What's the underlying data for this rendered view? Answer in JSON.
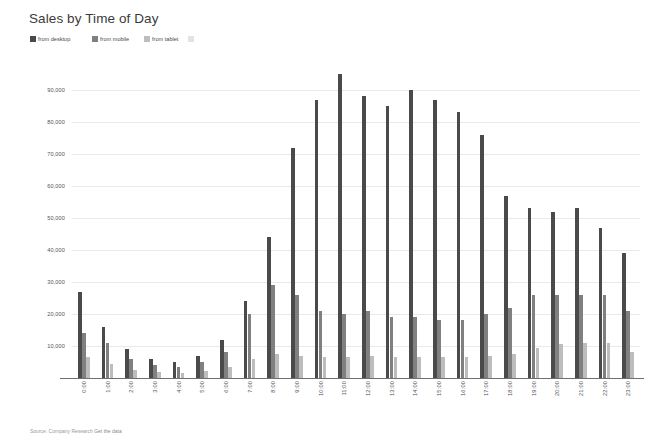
{
  "header": {
    "title": "Sales by Time of Day"
  },
  "legend": {
    "position": "top-left",
    "items": [
      {
        "label": "from desktop",
        "color": "#4a4a4a",
        "key": "desktop"
      },
      {
        "label": "from mobile",
        "color": "#808080",
        "key": "mobile"
      },
      {
        "label": "from tablet",
        "color": "#bdbdbd",
        "key": "tablet"
      }
    ]
  },
  "footer": {
    "source_label": "Source: Company Research",
    "link_label": "Get the data"
  },
  "axes": {
    "y_ticks": [
      "10,000",
      "20,000",
      "30,000",
      "40,000",
      "50,000",
      "60,000",
      "70,000",
      "80,000",
      "90,000"
    ],
    "y_tick_values": [
      10000,
      20000,
      30000,
      40000,
      50000,
      60000,
      70000,
      80000,
      90000
    ],
    "grid": true
  },
  "chart_data": {
    "type": "bar",
    "title": "Sales by Time of Day",
    "xlabel": "",
    "ylabel": "",
    "ylim": [
      0,
      95000
    ],
    "grid": true,
    "legend_position": "top-left",
    "categories": [
      "0:00",
      "1:00",
      "2:00",
      "3:00",
      "4:00",
      "5:00",
      "6:00",
      "7:00",
      "8:00",
      "9:00",
      "10:00",
      "11:00",
      "12:00",
      "13:00",
      "14:00",
      "15:00",
      "16:00",
      "17:00",
      "18:00",
      "19:00",
      "20:00",
      "21:00",
      "22:00",
      "23:00"
    ],
    "series": [
      {
        "name": "from desktop",
        "color": "#4a4a4a",
        "values": [
          27000,
          16000,
          9000,
          6000,
          5000,
          7000,
          12000,
          24000,
          44000,
          72000,
          87000,
          95000,
          88000,
          85000,
          90000,
          87000,
          83000,
          76000,
          57000,
          53000,
          52000,
          53000,
          47000,
          39000
        ]
      },
      {
        "name": "from mobile",
        "color": "#808080",
        "values": [
          14000,
          11000,
          6000,
          4000,
          3500,
          5000,
          8000,
          20000,
          29000,
          26000,
          21000,
          20000,
          21000,
          19000,
          19000,
          18000,
          18000,
          20000,
          22000,
          26000,
          26000,
          26000,
          26000,
          21000
        ]
      },
      {
        "name": "from tablet",
        "color": "#bdbdbd",
        "values": [
          6500,
          4500,
          2500,
          1800,
          1500,
          2200,
          3500,
          6000,
          7500,
          7000,
          6500,
          6500,
          6800,
          6500,
          6500,
          6500,
          6500,
          7000,
          7500,
          9500,
          10500,
          11000,
          11000,
          8000
        ]
      }
    ]
  }
}
